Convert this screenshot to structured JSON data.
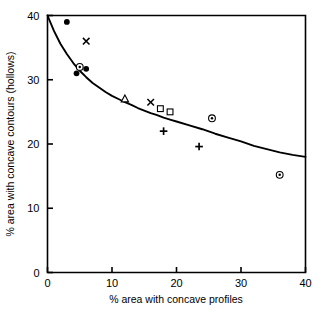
{
  "chart_data": {
    "type": "scatter",
    "title": "",
    "xlabel": "% area with concave profiles",
    "ylabel": "% area with concave contours (hollows)",
    "xlim": [
      0,
      40
    ],
    "ylim": [
      0,
      40
    ],
    "xticks": [
      0,
      10,
      20,
      30,
      40
    ],
    "yticks": [
      0,
      10,
      20,
      30,
      40
    ],
    "xtick_labels": [
      "0",
      "10",
      "20",
      "30",
      "40"
    ],
    "ytick_labels": [
      "0",
      "10",
      "20",
      "30",
      "40"
    ],
    "grid": false,
    "legend": "none",
    "series": [
      {
        "name": "filled-circle",
        "marker": "filled-circle",
        "points": [
          {
            "x": 3.0,
            "y": 39.0
          },
          {
            "x": 4.5,
            "y": 31.0
          },
          {
            "x": 6.0,
            "y": 31.7
          }
        ]
      },
      {
        "name": "circled-dot",
        "marker": "circled-dot",
        "points": [
          {
            "x": 5.0,
            "y": 32.0
          },
          {
            "x": 25.5,
            "y": 24.0
          },
          {
            "x": 36.0,
            "y": 15.2
          }
        ]
      },
      {
        "name": "cross",
        "marker": "x-cross",
        "points": [
          {
            "x": 6.0,
            "y": 36.0
          },
          {
            "x": 16.0,
            "y": 26.5
          }
        ]
      },
      {
        "name": "triangle",
        "marker": "open-triangle",
        "points": [
          {
            "x": 12.0,
            "y": 27.0
          }
        ]
      },
      {
        "name": "square",
        "marker": "open-square",
        "points": [
          {
            "x": 17.5,
            "y": 25.5
          },
          {
            "x": 19.0,
            "y": 25.0
          }
        ]
      },
      {
        "name": "plus",
        "marker": "plus",
        "points": [
          {
            "x": 18.0,
            "y": 22.0
          },
          {
            "x": 23.5,
            "y": 19.6
          }
        ]
      }
    ],
    "fit_curve": {
      "name": "fitted-trend-curve",
      "style": "solid",
      "color": "#000000",
      "points": [
        {
          "x": 0.0,
          "y": 40.0
        },
        {
          "x": 1.0,
          "y": 37.6
        },
        {
          "x": 2.0,
          "y": 35.6
        },
        {
          "x": 3.0,
          "y": 34.0
        },
        {
          "x": 4.0,
          "y": 32.6
        },
        {
          "x": 5.0,
          "y": 31.4
        },
        {
          "x": 6.0,
          "y": 30.4
        },
        {
          "x": 7.0,
          "y": 29.5
        },
        {
          "x": 8.0,
          "y": 28.8
        },
        {
          "x": 9.0,
          "y": 28.1
        },
        {
          "x": 10.0,
          "y": 27.5
        },
        {
          "x": 11.0,
          "y": 27.0
        },
        {
          "x": 12.0,
          "y": 26.5
        },
        {
          "x": 13.0,
          "y": 26.1
        },
        {
          "x": 14.0,
          "y": 25.6
        },
        {
          "x": 15.0,
          "y": 25.2
        },
        {
          "x": 16.0,
          "y": 24.8
        },
        {
          "x": 17.0,
          "y": 24.5
        },
        {
          "x": 18.0,
          "y": 24.1
        },
        {
          "x": 19.0,
          "y": 23.8
        },
        {
          "x": 20.0,
          "y": 23.5
        },
        {
          "x": 22.0,
          "y": 22.9
        },
        {
          "x": 24.0,
          "y": 22.3
        },
        {
          "x": 26.0,
          "y": 21.6
        },
        {
          "x": 28.0,
          "y": 21.0
        },
        {
          "x": 30.0,
          "y": 20.4
        },
        {
          "x": 32.0,
          "y": 19.7
        },
        {
          "x": 34.0,
          "y": 19.2
        },
        {
          "x": 36.0,
          "y": 18.7
        },
        {
          "x": 38.0,
          "y": 18.3
        },
        {
          "x": 40.0,
          "y": 18.0
        }
      ]
    }
  },
  "axes": {
    "x_title": "% area with concave profiles",
    "y_title": "% area with concave contours (hollows)",
    "x_ticks": [
      "0",
      "10",
      "20",
      "30",
      "40"
    ],
    "y_ticks": [
      "0",
      "10",
      "20",
      "30",
      "40"
    ]
  },
  "colors": {
    "ink": "#000000",
    "background": "#ffffff"
  }
}
